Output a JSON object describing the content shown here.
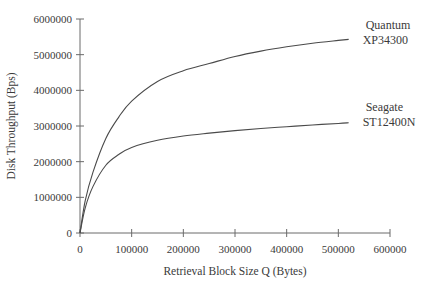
{
  "chart_data": {
    "type": "line",
    "title": "",
    "xlabel": "Retrieval Block Size Q (Bytes)",
    "ylabel": "Disk Throughput (Bps)",
    "xlim": [
      0,
      600000
    ],
    "ylim": [
      0,
      6000000
    ],
    "grid": false,
    "legend": "inline labels at line ends",
    "x_ticks": [
      0,
      100000,
      200000,
      300000,
      400000,
      500000,
      600000
    ],
    "x_tick_labels": [
      "0",
      "100000",
      "200000",
      "300000",
      "400000",
      "500000",
      "600000"
    ],
    "y_ticks": [
      0,
      1000000,
      2000000,
      3000000,
      4000000,
      5000000,
      6000000
    ],
    "y_tick_labels": [
      "0",
      "1000000",
      "2000000",
      "3000000",
      "4000000",
      "5000000",
      "6000000"
    ],
    "x": [
      0,
      10000,
      25000,
      50000,
      75000,
      100000,
      150000,
      200000,
      250000,
      300000,
      350000,
      400000,
      450000,
      500000,
      520000
    ],
    "series": [
      {
        "name": "Quantum XP34300",
        "label_lines": [
          "Quantum",
          "XP34300"
        ],
        "values": [
          0,
          900000,
          1700000,
          2650000,
          3250000,
          3700000,
          4250000,
          4550000,
          4750000,
          4950000,
          5100000,
          5220000,
          5320000,
          5400000,
          5430000
        ]
      },
      {
        "name": "Seagate ST12400N",
        "label_lines": [
          "Seagate",
          "ST12400N"
        ],
        "values": [
          0,
          700000,
          1300000,
          1900000,
          2200000,
          2400000,
          2600000,
          2720000,
          2800000,
          2870000,
          2930000,
          2980000,
          3030000,
          3070000,
          3090000
        ]
      }
    ]
  },
  "colors": {
    "line": "#4a4a4a",
    "axis": "#6a6a6a",
    "text": "#3a3a3a"
  }
}
